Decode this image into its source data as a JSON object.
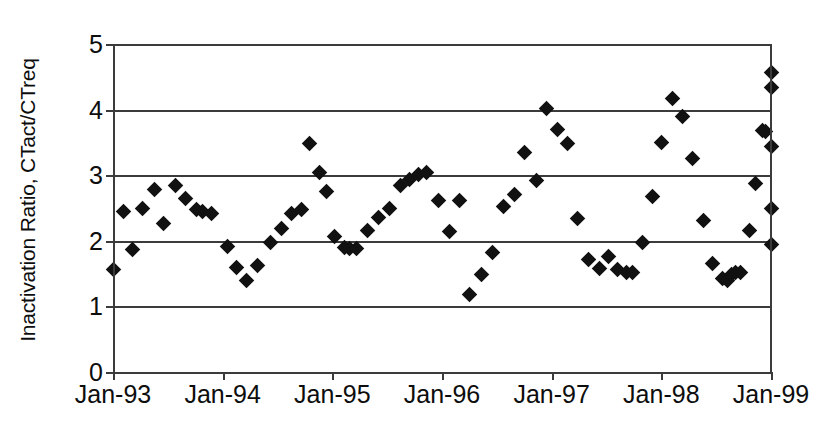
{
  "chart_data": {
    "type": "scatter",
    "title": "",
    "xlabel": "",
    "ylabel": "Inactivation Ratio, CTact/CTreq",
    "ylim": [
      0,
      5
    ],
    "ytick_labels": [
      "0",
      "1",
      "2",
      "3",
      "4",
      "5"
    ],
    "ytick_values": [
      0,
      1,
      2,
      3,
      4,
      5
    ],
    "xtick_labels": [
      "Jan-93",
      "Jan-94",
      "Jan-95",
      "Jan-96",
      "Jan-97",
      "Jan-98",
      "Jan-99"
    ],
    "xtick_values": [
      1993.0,
      1994.0,
      1995.0,
      1996.0,
      1997.0,
      1998.0,
      1999.0
    ],
    "xlim": [
      1993.0,
      1999.0
    ],
    "grid": "horizontal",
    "legend": "none",
    "marker_shape": "diamond",
    "marker_color": "#111111",
    "series": [
      {
        "name": "Inactivation Ratio",
        "points": [
          [
            1993.0,
            1.56
          ],
          [
            1993.1,
            2.45
          ],
          [
            1993.18,
            1.86
          ],
          [
            1993.27,
            2.5
          ],
          [
            1993.38,
            2.78
          ],
          [
            1993.46,
            2.26
          ],
          [
            1993.57,
            2.84
          ],
          [
            1993.66,
            2.64
          ],
          [
            1993.76,
            2.48
          ],
          [
            1993.82,
            2.45
          ],
          [
            1993.9,
            2.41
          ],
          [
            1994.04,
            1.92
          ],
          [
            1994.13,
            1.59
          ],
          [
            1994.22,
            1.4
          ],
          [
            1994.32,
            1.63
          ],
          [
            1994.44,
            1.98
          ],
          [
            1994.54,
            2.18
          ],
          [
            1994.63,
            2.42
          ],
          [
            1994.72,
            2.47
          ],
          [
            1994.79,
            3.49
          ],
          [
            1994.88,
            3.04
          ],
          [
            1994.95,
            2.75
          ],
          [
            1995.02,
            2.06
          ],
          [
            1995.11,
            1.9
          ],
          [
            1995.16,
            1.88
          ],
          [
            1995.22,
            1.88
          ],
          [
            1995.32,
            2.16
          ],
          [
            1995.42,
            2.35
          ],
          [
            1995.52,
            2.5
          ],
          [
            1995.62,
            2.84
          ],
          [
            1995.7,
            2.94
          ],
          [
            1995.79,
            3.01
          ],
          [
            1995.86,
            3.04
          ],
          [
            1995.97,
            2.62
          ],
          [
            1996.07,
            2.14
          ],
          [
            1996.16,
            2.62
          ],
          [
            1996.25,
            1.18
          ],
          [
            1996.36,
            1.48
          ],
          [
            1996.46,
            1.82
          ],
          [
            1996.56,
            2.52
          ],
          [
            1996.66,
            2.7
          ],
          [
            1996.75,
            3.34
          ],
          [
            1996.86,
            2.92
          ],
          [
            1996.95,
            4.01
          ],
          [
            1997.05,
            3.69
          ],
          [
            1997.14,
            3.48
          ],
          [
            1997.24,
            2.34
          ],
          [
            1997.34,
            1.72
          ],
          [
            1997.44,
            1.58
          ],
          [
            1997.52,
            1.76
          ],
          [
            1997.6,
            1.56
          ],
          [
            1997.68,
            1.52
          ],
          [
            1997.74,
            1.52
          ],
          [
            1997.83,
            1.97
          ],
          [
            1997.92,
            2.67
          ],
          [
            1998.0,
            3.5
          ],
          [
            1998.1,
            4.17
          ],
          [
            1998.19,
            3.89
          ],
          [
            1998.28,
            3.25
          ],
          [
            1998.38,
            2.31
          ],
          [
            1998.47,
            1.65
          ],
          [
            1998.56,
            1.42
          ],
          [
            1998.6,
            1.4
          ],
          [
            1998.64,
            1.48
          ],
          [
            1998.68,
            1.52
          ],
          [
            1998.72,
            1.52
          ],
          [
            1998.8,
            2.15
          ],
          [
            1998.86,
            2.88
          ],
          [
            1998.92,
            3.68
          ],
          [
            1998.95,
            3.67
          ],
          [
            1999.0,
            4.56
          ],
          [
            1999.0,
            4.34
          ],
          [
            1999.0,
            3.44
          ],
          [
            1999.0,
            2.5
          ],
          [
            1999.0,
            1.95
          ]
        ]
      }
    ]
  },
  "axis": {
    "y_title": "Inactivation Ratio, CTact/CTreq"
  }
}
